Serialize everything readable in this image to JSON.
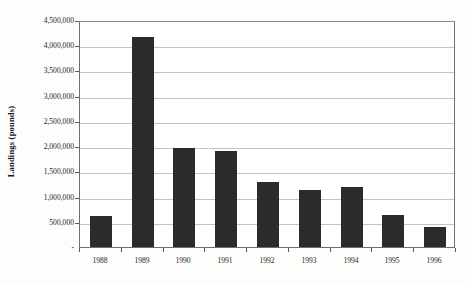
{
  "chart_data": {
    "type": "bar",
    "title": "",
    "xlabel": "",
    "ylabel": "Landings  (pounds)",
    "categories": [
      "1988",
      "1989",
      "1990",
      "1991",
      "1992",
      "1993",
      "1994",
      "1995",
      "1996"
    ],
    "values": [
      620000,
      4160000,
      1960000,
      1910000,
      1280000,
      1130000,
      1190000,
      630000,
      400000
    ],
    "ylim": [
      0,
      4500000
    ],
    "ytick_step": 500000,
    "ytick_labels": [
      "-",
      "500,000",
      "1,000,000",
      "1,500,000",
      "2,000,000",
      "2,500,000",
      "3,000,000",
      "3,500,000",
      "4,000,000",
      "4,500,000"
    ],
    "ytick_values": [
      0,
      500000,
      1000000,
      1500000,
      2000000,
      2500000,
      3000000,
      3500000,
      4000000,
      4500000
    ],
    "grid": true,
    "grid_axis": "y",
    "legend": false,
    "legend_position": "none",
    "series": [
      {
        "name": "Landings",
        "color": "#2b2b2b",
        "values": [
          620000,
          4160000,
          1960000,
          1910000,
          1280000,
          1130000,
          1190000,
          630000,
          400000
        ]
      }
    ]
  },
  "style": {
    "bar_color": "#2b2b2b",
    "gridline_color": "#c4c4c4",
    "frame_color": "#6f6f6f",
    "background_color": "#fdfdfc",
    "plot_background_color": "#ffffff",
    "text_color": "#1d1d1d"
  }
}
